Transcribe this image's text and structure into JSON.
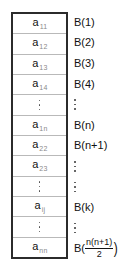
{
  "figure": {
    "colors": {
      "outer_border": "#2b2b2b",
      "row_divider": "#b9b9b9",
      "text": "#111111",
      "subscript": "#8a8a8a",
      "background": "#ffffff"
    }
  },
  "array_column": {
    "name": "upper triangular array elements",
    "cells": [
      {
        "kind": "term",
        "base": "a",
        "sub": "11",
        "text": "a11"
      },
      {
        "kind": "term",
        "base": "a",
        "sub": "12",
        "text": "a12"
      },
      {
        "kind": "term",
        "base": "a",
        "sub": "13",
        "text": "a13"
      },
      {
        "kind": "term",
        "base": "a",
        "sub": "14",
        "text": "a14"
      },
      {
        "kind": "dots",
        "text": "⋮"
      },
      {
        "kind": "term",
        "base": "a",
        "sub": "1n",
        "text": "a1n"
      },
      {
        "kind": "term",
        "base": "a",
        "sub": "22",
        "text": "a22"
      },
      {
        "kind": "term",
        "base": "a",
        "sub": "23",
        "text": "a23"
      },
      {
        "kind": "dots",
        "text": "⋮"
      },
      {
        "kind": "term",
        "base": "a",
        "sub": "ij",
        "text": "aij"
      },
      {
        "kind": "dots",
        "text": "⋮"
      },
      {
        "kind": "term",
        "base": "a",
        "sub": "nn",
        "text": "ann"
      }
    ]
  },
  "b_labels": {
    "name": "linear storage index labels",
    "rows": [
      {
        "kind": "text",
        "text": "B(1)"
      },
      {
        "kind": "text",
        "text": "B(2)"
      },
      {
        "kind": "text",
        "text": "B(3)"
      },
      {
        "kind": "text",
        "text": "B(4)"
      },
      {
        "kind": "dots",
        "text": "⋮"
      },
      {
        "kind": "text",
        "text": "B(n)"
      },
      {
        "kind": "text",
        "text": "B(n+1)"
      },
      {
        "kind": "dots",
        "text": "⋮"
      },
      {
        "kind": "dots",
        "text": "⋮"
      },
      {
        "kind": "text",
        "text": "B(k)"
      },
      {
        "kind": "dots",
        "text": "⋮"
      },
      {
        "kind": "fraction",
        "prefix": "B(",
        "numerator": "n(n+1)",
        "denominator": "2",
        "suffix": ")",
        "text": "B(n(n+1)/2)"
      }
    ]
  }
}
